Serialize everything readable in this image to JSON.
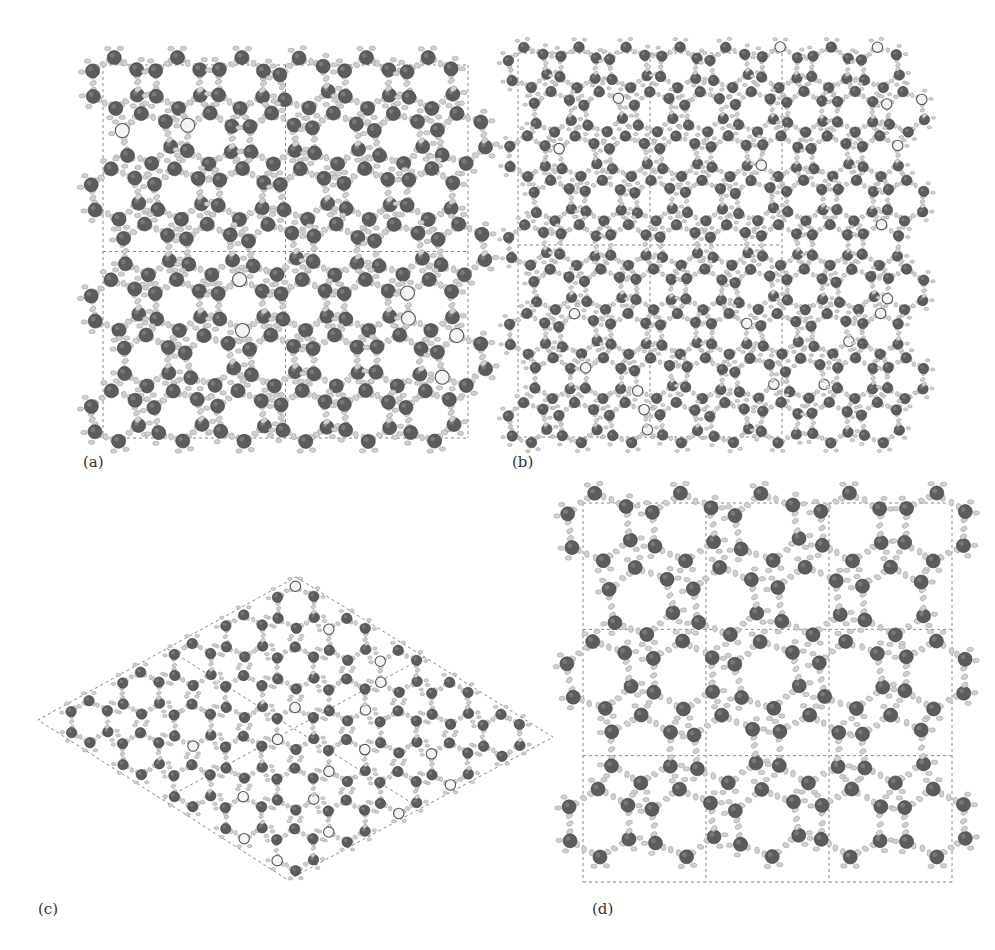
{
  "figure": {
    "panels": [
      {
        "id": "a",
        "label": "(a)",
        "view": "square 2x2 supercell",
        "grid": {
          "cols": 2,
          "rows": 2
        }
      },
      {
        "id": "b",
        "label": "(b)",
        "view": "rectangular 2x2 supercell, denser packing",
        "grid": {
          "cols": 2,
          "rows": 2
        }
      },
      {
        "id": "c",
        "label": "(c)",
        "view": "hexagonal (rhombic) 2x2 supercell",
        "grid": {
          "cols": 2,
          "rows": 2
        }
      },
      {
        "id": "d",
        "label": "(d)",
        "view": "square 3x3 supercell",
        "grid": {
          "cols": 3,
          "rows": 3
        }
      }
    ],
    "caption_visible": false
  },
  "colors": {
    "cell_line": "#888888",
    "heavy_atom": "#5c5c5c",
    "hydrogen": "#d0d0d0",
    "open_atom": "#f4f4f4",
    "background": "#ffffff"
  },
  "layout": {
    "a": {
      "x": 103,
      "y": 65,
      "w": 365,
      "h": 373
    },
    "b": {
      "x": 518,
      "y": 53,
      "w": 264,
      "h": 384
    },
    "c": {
      "top": [
        296,
        577
      ],
      "right": [
        553,
        737
      ],
      "bottom": [
        288,
        880
      ],
      "left": [
        38,
        720
      ]
    },
    "d": {
      "x": 583,
      "y": 503,
      "w": 369,
      "h": 379
    }
  }
}
